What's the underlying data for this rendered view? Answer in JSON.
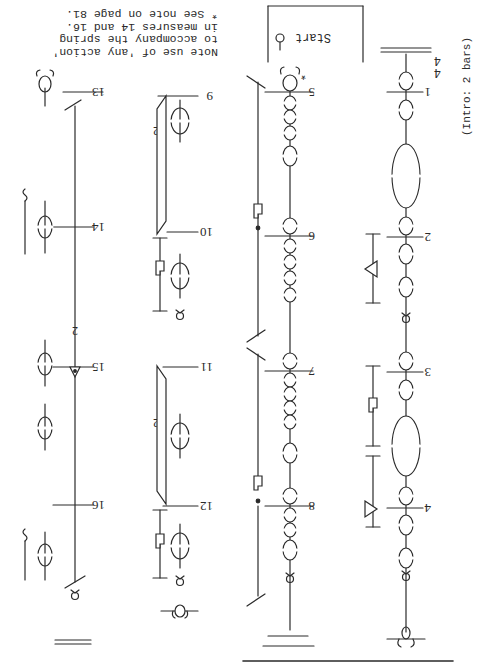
{
  "page": {
    "orientation": "rotated 180 degrees",
    "intro_label": "(Intro: 2 bars)",
    "time_signature": {
      "top": "4",
      "bottom": "4"
    },
    "start_label": "Start",
    "note_lines": [
      "Note use of 'any action'",
      "to accompany the spring",
      "in measures 14 and 16.",
      "* See note on page 81."
    ],
    "asterisk": "*"
  },
  "staves": [
    {
      "id": "staff-1",
      "measures": [
        "1",
        "2",
        "3",
        "4"
      ]
    },
    {
      "id": "staff-2",
      "measures": [
        "5",
        "6",
        "7",
        "8"
      ]
    },
    {
      "id": "staff-3",
      "measures": [
        "9",
        "10",
        "11",
        "12"
      ]
    },
    {
      "id": "staff-4",
      "measures": [
        "13",
        "14",
        "15",
        "16"
      ]
    }
  ],
  "repeat_labels": {
    "staff3_m9": "2",
    "staff3_m11": "2",
    "staff4_m15": "2"
  },
  "colors": {
    "ink": "#2a2a2a",
    "paper": "#ffffff"
  }
}
